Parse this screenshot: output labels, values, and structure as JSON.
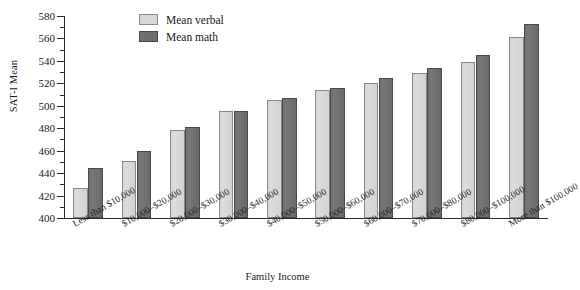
{
  "chart_data": {
    "type": "bar",
    "title": "",
    "xlabel": "Family Income",
    "ylabel": "SAT-I Mean",
    "ylim": [
      400,
      580
    ],
    "ytick_step": 20,
    "yminor_step": 10,
    "grid": false,
    "legend_position": "top-center",
    "yticks": [
      400,
      420,
      440,
      460,
      480,
      500,
      520,
      540,
      560,
      580
    ],
    "categories": [
      "Less than $10,000",
      "$10,000–$20,000",
      "$20,000–$30,000",
      "$30,000–$40,000",
      "$40,000–$50,000",
      "$50,000–$60,000",
      "$60,000–$70,000",
      "$70,000–$80,000",
      "$80,000–$100,000",
      "More than $100,000"
    ],
    "series": [
      {
        "name": "Mean verbal",
        "color": "#d8d8d8",
        "values": [
          427,
          451,
          478,
          495,
          505,
          514,
          520,
          529,
          539,
          561
        ]
      },
      {
        "name": "Mean math",
        "color": "#6f6f6f",
        "values": [
          445,
          460,
          481,
          495,
          507,
          516,
          525,
          534,
          545,
          573
        ]
      }
    ]
  },
  "legend": {
    "items": [
      {
        "label": "Mean verbal",
        "key": "verbal"
      },
      {
        "label": "Mean math",
        "key": "math"
      }
    ]
  },
  "axes": {
    "y_title": "SAT-I Mean",
    "x_title": "Family Income"
  }
}
